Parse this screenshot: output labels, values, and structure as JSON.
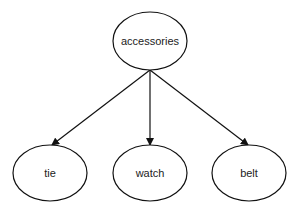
{
  "diagram": {
    "type": "tree",
    "root": {
      "id": "accessories",
      "label": "accessories",
      "cx": 150,
      "cy": 41,
      "rx": 37,
      "ry": 29
    },
    "children": [
      {
        "id": "tie",
        "label": "tie",
        "cx": 50,
        "cy": 173,
        "rx": 37,
        "ry": 28
      },
      {
        "id": "watch",
        "label": "watch",
        "cx": 150,
        "cy": 173,
        "rx": 37,
        "ry": 28
      },
      {
        "id": "belt",
        "label": "belt",
        "cx": 249,
        "cy": 173,
        "rx": 37,
        "ry": 28
      }
    ],
    "edges": [
      {
        "from": "accessories",
        "to": "tie"
      },
      {
        "from": "accessories",
        "to": "watch"
      },
      {
        "from": "accessories",
        "to": "belt"
      }
    ],
    "colors": {
      "stroke": "#111111",
      "fill": "#ffffff",
      "text": "#222222"
    }
  }
}
